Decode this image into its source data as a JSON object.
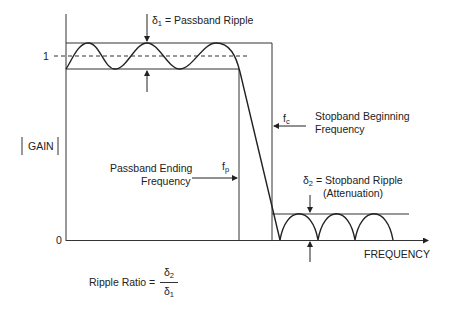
{
  "diagram": {
    "y_axis": {
      "label": "GAIN",
      "tick_one": "1",
      "tick_zero": "0"
    },
    "x_axis": {
      "label": "FREQUENCY"
    },
    "annotations": {
      "delta1": {
        "symbol": "δ",
        "sub": "1",
        "text": " = Passband Ripple"
      },
      "delta2": {
        "symbol": "δ",
        "sub": "2",
        "text": " = Stopband Ripple",
        "text2": "(Attenuation)"
      },
      "fc": {
        "symbol": "f",
        "sub": "c",
        "line1": "Stopband Beginning",
        "line2": "Frequency"
      },
      "fp": {
        "symbol": "f",
        "sub": "p",
        "line1": "Passband Ending",
        "line2": "Frequency"
      }
    },
    "ripple_ratio": {
      "label": "Ripple Ratio =",
      "numerator": "δ",
      "numerator_sub": "2",
      "denominator": "δ",
      "denominator_sub": "1"
    },
    "colors": {
      "line": "#333333",
      "text": "#222222",
      "background": "#ffffff"
    }
  }
}
